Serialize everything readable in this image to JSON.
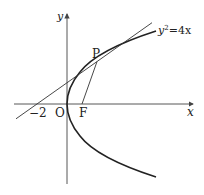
{
  "diagram": {
    "type": "parabola-tangent",
    "equation": "y²=4x",
    "equation_parts": {
      "base": "y",
      "exp": "2",
      "rest": "=4x"
    },
    "axes": {
      "x_label": "x",
      "y_label": "y"
    },
    "points": {
      "origin": "O",
      "focus": "F",
      "tangent_point": "P",
      "x_intercept": "−2"
    },
    "colors": {
      "curve": "#222222",
      "line": "#333333",
      "axis": "#444444"
    }
  }
}
